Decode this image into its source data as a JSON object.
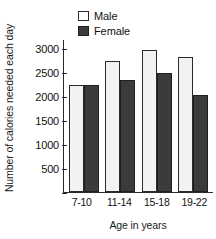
{
  "chart_data": {
    "type": "bar",
    "title": "",
    "subtitle": "",
    "xlabel": "Age in years",
    "ylabel": "Number of calories needed each day",
    "categories": [
      "7-10",
      "11-14",
      "15-18",
      "19-22"
    ],
    "series": [
      {
        "name": "Male",
        "values": [
          2250,
          2750,
          3000,
          2850
        ],
        "color": "#f2f2f2"
      },
      {
        "name": "Female",
        "values": [
          2250,
          2350,
          2500,
          2050
        ],
        "color": "#3b3b3b"
      }
    ],
    "ylim": [
      0,
      3200
    ],
    "yticks": [
      500,
      1000,
      1500,
      2000,
      2500,
      3000
    ],
    "ytick_labels": [
      "500",
      "1000",
      "1500",
      "2000",
      "2500",
      "3000"
    ],
    "grid": false,
    "legend_position": "top-center",
    "legend_entries": [
      "Male",
      "Female"
    ]
  },
  "axis": {
    "y_title": "Number of calories needed each day",
    "x_title": "Age in years"
  },
  "legend": {
    "male_label": "Male",
    "female_label": "Female"
  },
  "xticks": {
    "t0": "7-10",
    "t1": "11-14",
    "t2": "15-18",
    "t3": "19-22"
  },
  "yticks": {
    "y0": "500",
    "y1": "1000",
    "y2": "1500",
    "y3": "2000",
    "y4": "2500",
    "y5": "3000"
  }
}
